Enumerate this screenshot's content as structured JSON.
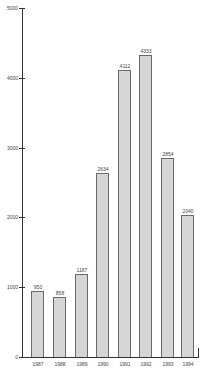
{
  "chart_data": {
    "type": "bar",
    "title": "",
    "xlabel": "",
    "ylabel": "",
    "categories": [
      "1987",
      "1988",
      "1989",
      "1990",
      "1991",
      "1992",
      "1993",
      "1994"
    ],
    "values": [
      950,
      858,
      1187,
      2634,
      4112,
      4333,
      2854,
      2040
    ],
    "value_labels": [
      "950",
      "858",
      "1187",
      "2634",
      "4112",
      "4333",
      "2854",
      "2040"
    ],
    "ylim": [
      0,
      5000
    ],
    "yticks": [
      0,
      1000,
      2000,
      3000,
      4000,
      5000
    ],
    "ytick_labels": [
      "0",
      "1000",
      "2000",
      "3000",
      "4000",
      "5000"
    ],
    "grid": false,
    "legend": null,
    "bar_color": "#d6d6d6",
    "bar_edge_color": "#6a6a6a"
  }
}
